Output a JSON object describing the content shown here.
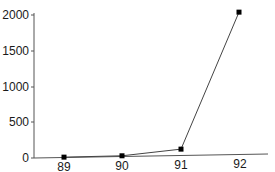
{
  "chart_data": {
    "type": "line",
    "title": "",
    "xlabel": "",
    "ylabel": "",
    "categories": [
      "89",
      "90",
      "91",
      "92"
    ],
    "series": [
      {
        "name": "series-1",
        "values": [
          5,
          10,
          110,
          2040
        ],
        "marker": "square",
        "color": "#000000"
      }
    ],
    "yticks": [
      0,
      500,
      1000,
      1500,
      2000
    ],
    "ylim": [
      0,
      2050
    ],
    "grid": false,
    "legend": null
  },
  "axis": {
    "y_tick_labels": [
      "0",
      "500",
      "1000",
      "1500",
      "2000"
    ],
    "x_tick_labels": [
      "89",
      "90",
      "91",
      "92"
    ]
  }
}
